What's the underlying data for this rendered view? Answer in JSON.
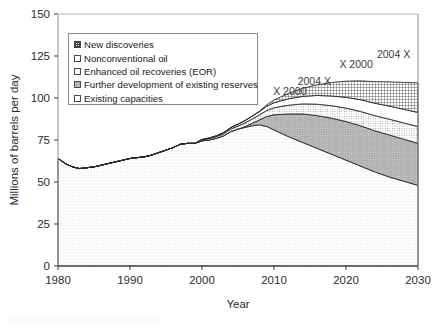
{
  "figure": {
    "background": "#ffffff",
    "frame_color": "#888888"
  },
  "legend": {
    "position": "inside-upper-left",
    "border_color": "#8a8a8a",
    "items": [
      {
        "label": "New discoveries",
        "swatch": "cross-hatch",
        "color": "#3c3c3c"
      },
      {
        "label": "Nonconventional oil",
        "swatch": "white",
        "color": "#ffffff"
      },
      {
        "label": "Enhanced oil recoveries (EOR)",
        "swatch": "fine-dot",
        "color": "#6a6a6a"
      },
      {
        "label": "Further development of existing reserves",
        "swatch": "gray-fill",
        "color": "#b4b4b4"
      },
      {
        "label": "Existing capacities",
        "swatch": "light-dot",
        "color": "#d9d9d9"
      }
    ]
  },
  "annotations": [
    {
      "text": "X 2000",
      "x_year": 2012.2,
      "y_value": 101.5
    },
    {
      "text": "2004 X",
      "x_year": 2015.6,
      "y_value": 108.0
    },
    {
      "text": "X 2000",
      "x_year": 2021.4,
      "y_value": 118.0
    },
    {
      "text": "2004 X",
      "x_year": 2026.6,
      "y_value": 124.0
    }
  ],
  "chart_data": {
    "type": "area",
    "title": "",
    "subtitle": "",
    "xlabel": "Year",
    "ylabel": "Millions of barrels per day",
    "xlim": [
      1980,
      2030
    ],
    "ylim": [
      0,
      150
    ],
    "xticks": [
      1980,
      1990,
      2000,
      2010,
      2020,
      2030
    ],
    "yticks": [
      0,
      25,
      50,
      75,
      100,
      125,
      150
    ],
    "grid": false,
    "stacked": true,
    "stack_order_bottom_to_top": [
      "Existing capacities",
      "Further development of existing reserves",
      "Enhanced oil recoveries (EOR)",
      "Nonconventional oil",
      "New discoveries"
    ],
    "x": [
      1980,
      1981,
      1982,
      1983,
      1984,
      1985,
      1986,
      1987,
      1988,
      1989,
      1990,
      1991,
      1992,
      1993,
      1994,
      1995,
      1996,
      1997,
      1998,
      1999,
      2000,
      2001,
      2002,
      2003,
      2004,
      2005,
      2006,
      2007,
      2008,
      2009,
      2010,
      2012,
      2014,
      2016,
      2018,
      2020,
      2022,
      2024,
      2026,
      2028,
      2030
    ],
    "series": [
      {
        "name": "Existing capacities",
        "fill": "light-dot",
        "color": "#e2e2e2",
        "values": [
          64,
          61,
          59,
          58,
          58.5,
          59,
          60,
          61,
          62,
          63,
          64,
          64.5,
          65,
          66,
          67.5,
          69,
          70.5,
          72.5,
          73,
          73,
          74.5,
          75,
          76,
          77.5,
          80,
          81.5,
          82.5,
          83.5,
          84,
          83,
          81,
          77,
          73.5,
          70,
          66.5,
          63,
          59.5,
          56,
          53,
          50.5,
          48
        ]
      },
      {
        "name": "Further development of existing reserves",
        "fill": "gray-fill",
        "color": "#b4b4b4",
        "values": [
          0,
          0,
          0,
          0,
          0,
          0,
          0,
          0,
          0,
          0,
          0,
          0,
          0,
          0,
          0,
          0,
          0,
          0,
          0,
          0,
          0,
          0,
          0,
          0,
          0,
          0,
          0.5,
          1.5,
          3,
          6,
          9,
          13.5,
          17,
          19.5,
          21.5,
          23,
          24,
          24.5,
          25,
          25,
          25
        ]
      },
      {
        "name": "Enhanced oil recoveries (EOR)",
        "fill": "fine-dot",
        "color": "#c8c8c8",
        "values": [
          0,
          0,
          0,
          0,
          0,
          0,
          0,
          0,
          0,
          0,
          0,
          0,
          0,
          0,
          0,
          0,
          0,
          0,
          0,
          0,
          0.5,
          0.8,
          1,
          1.2,
          1.5,
          1.8,
          2.2,
          2.6,
          3,
          3.6,
          4.2,
          5.2,
          6,
          6.8,
          7.4,
          8,
          8.5,
          9,
          9.4,
          9.7,
          10
        ]
      },
      {
        "name": "Nonconventional oil",
        "fill": "white",
        "color": "#ffffff",
        "values": [
          0,
          0,
          0,
          0,
          0,
          0,
          0,
          0,
          0,
          0,
          0,
          0,
          0,
          0,
          0,
          0,
          0,
          0,
          0,
          0,
          0.3,
          0.4,
          0.5,
          0.7,
          0.9,
          1.1,
          1.4,
          1.7,
          2,
          2.5,
          3,
          3.8,
          4.5,
          5.2,
          5.8,
          6.4,
          7,
          7.4,
          7.8,
          8.1,
          8.4
        ]
      },
      {
        "name": "New discoveries",
        "fill": "cross-hatch",
        "color": "#555555",
        "values": [
          0,
          0,
          0,
          0,
          0,
          0,
          0,
          0,
          0,
          0,
          0,
          0,
          0,
          0,
          0,
          0,
          0,
          0,
          0,
          0,
          0,
          0,
          0,
          0,
          0,
          0,
          0,
          0,
          0.2,
          0.8,
          1.6,
          3.2,
          4.8,
          6.4,
          8,
          9.6,
          11.2,
          12.8,
          14.4,
          16,
          17.6
        ]
      }
    ],
    "total_top_values": [
      64,
      61,
      59,
      58,
      58.5,
      59,
      60,
      61,
      62,
      63,
      64,
      64.5,
      65,
      66,
      67.5,
      69,
      70.5,
      72.5,
      73,
      73,
      75.3,
      76.2,
      77.5,
      79.4,
      82.4,
      84.4,
      86.6,
      89.3,
      92.2,
      95.9,
      98.8,
      102.7,
      105.8,
      107.9,
      109.2,
      110,
      110.2,
      109.7,
      109.6,
      109.3,
      109
    ]
  }
}
